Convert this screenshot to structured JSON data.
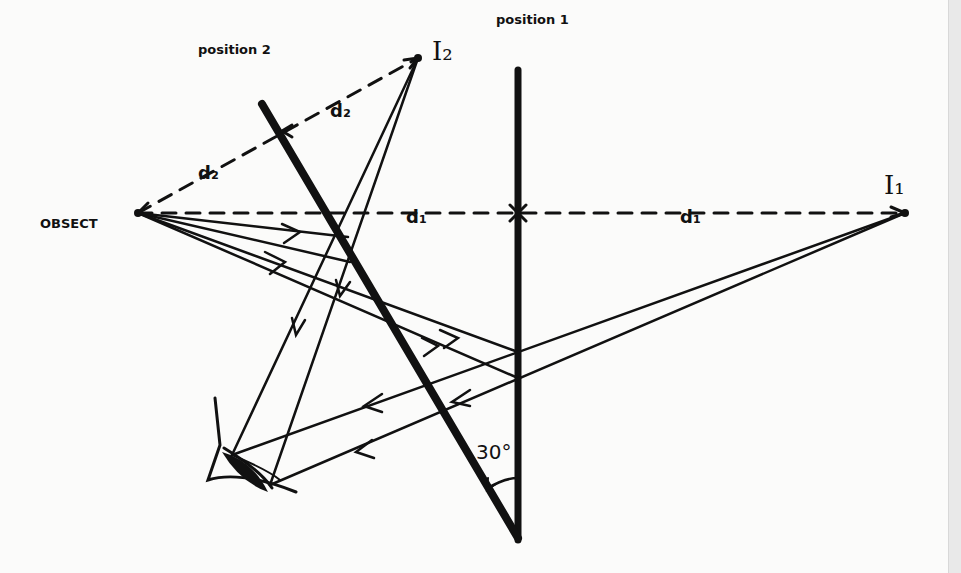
{
  "diagram": {
    "labels": {
      "object": "OBSECT",
      "position_1": "position 1",
      "position_2": "position 2",
      "image_1": "I₁",
      "image_2": "I₂",
      "d1_left": "d₁",
      "d1_right": "d₁",
      "d2_upper": "d₂",
      "d2_lower": "d₂",
      "angle": "30°"
    },
    "colors": {
      "ink": "#111111",
      "paper": "#fbfbfa"
    }
  }
}
